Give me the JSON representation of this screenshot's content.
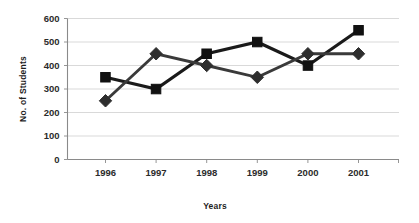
{
  "chart_data": {
    "type": "line",
    "title": "",
    "xlabel": "Years",
    "ylabel": "No. of Students",
    "categories": [
      "1996",
      "1997",
      "1998",
      "1999",
      "2000",
      "2001"
    ],
    "series": [
      {
        "name": "series-squares",
        "marker": "square",
        "color": "#111111",
        "values": [
          350,
          300,
          450,
          500,
          400,
          550
        ]
      },
      {
        "name": "series-diamonds",
        "marker": "diamond",
        "color": "#2e2e2e",
        "values": [
          250,
          450,
          400,
          350,
          450,
          450
        ]
      }
    ],
    "ylim": [
      0,
      600
    ],
    "ytick_labels": [
      "0",
      "100",
      "200",
      "300",
      "400",
      "500",
      "600"
    ],
    "ytick_values": [
      0,
      100,
      200,
      300,
      400,
      500,
      600
    ],
    "grid": true,
    "legend": "none",
    "legend_position": "none"
  }
}
